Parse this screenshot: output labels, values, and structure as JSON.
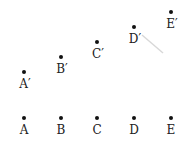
{
  "points": [
    {
      "label": "A",
      "x": 24,
      "y": 118
    },
    {
      "label": "B",
      "x": 61,
      "y": 118
    },
    {
      "label": "C",
      "x": 97,
      "y": 118
    },
    {
      "label": "D",
      "x": 134,
      "y": 118
    },
    {
      "label": "E",
      "x": 171,
      "y": 118
    },
    {
      "label": "A′",
      "x": 24,
      "y": 72
    },
    {
      "label": "B′",
      "x": 61,
      "y": 57
    },
    {
      "label": "C′",
      "x": 97,
      "y": 42
    },
    {
      "label": "D′",
      "x": 134,
      "y": 27
    },
    {
      "label": "E′",
      "x": 171,
      "y": 12
    }
  ],
  "colors": {
    "dot": "#111111",
    "text": "#222222",
    "faint_line": "#d8d8d8"
  },
  "faint_line": {
    "x1": 142,
    "y1": 35,
    "x2": 163,
    "y2": 53
  }
}
